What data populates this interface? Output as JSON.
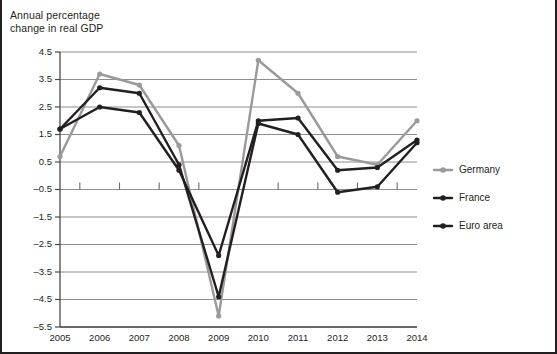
{
  "chart_data": {
    "type": "line",
    "title": "Annual percentage change in real GDP",
    "title_line1": "Annual percentage",
    "title_line2": "change in real GDP",
    "xlabel": "",
    "ylabel": "",
    "categories": [
      "2005",
      "2006",
      "2007",
      "2008",
      "2009",
      "2010",
      "2011",
      "2012",
      "2013",
      "2014"
    ],
    "ylim": [
      -5.5,
      4.5
    ],
    "ytick_labels": [
      "4.5",
      "3.5",
      "2.5",
      "1.5",
      "0.5",
      "–0.5",
      "–1.5",
      "–2.5",
      "–3.5",
      "–4.5",
      "–5.5"
    ],
    "ytick_values": [
      4.5,
      3.5,
      2.5,
      1.5,
      0.5,
      -0.5,
      -1.5,
      -2.5,
      -3.5,
      -4.5,
      -5.5
    ],
    "grid": true,
    "legend_position": "right",
    "series": [
      {
        "name": "Germany",
        "color": "#9a9a9a",
        "values": [
          0.7,
          3.7,
          3.3,
          1.1,
          -5.1,
          4.2,
          3.0,
          0.7,
          0.4,
          2.0
        ]
      },
      {
        "name": "France",
        "color": "#231f20",
        "values": [
          1.7,
          2.5,
          2.3,
          0.2,
          -2.9,
          2.0,
          2.1,
          0.2,
          0.3,
          1.3
        ]
      },
      {
        "name": "Euro area",
        "color": "#231f20",
        "values": [
          1.7,
          3.2,
          3.0,
          0.4,
          -4.4,
          1.9,
          1.5,
          -0.6,
          -0.4,
          1.2
        ]
      }
    ]
  },
  "colors": {
    "germany": "#9a9a9a",
    "france": "#231f20",
    "euro_area": "#231f20",
    "gridline": "#8d8d8d",
    "axis": "#4a4a4a",
    "border": "#231f20",
    "text": "#231f20",
    "background": "#ffffff"
  }
}
